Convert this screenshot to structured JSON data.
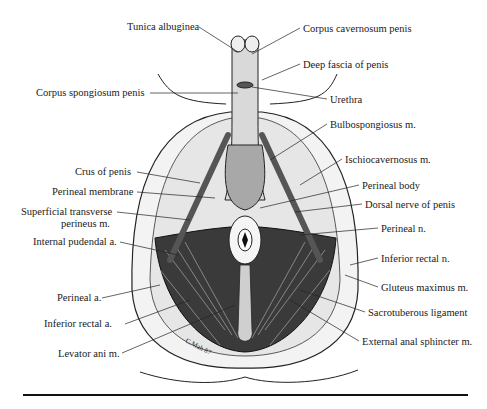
{
  "figure": {
    "signature": "C.Mah 87",
    "labels_left": [
      {
        "id": "tunica-albuginea",
        "text": "Tunica albuginea",
        "x": 127,
        "y": 21
      },
      {
        "id": "corpus-spongiosum",
        "text": "Corpus spongiosum penis",
        "x": 36,
        "y": 87
      },
      {
        "id": "crus-of-penis",
        "text": "Crus of penis",
        "x": 75,
        "y": 166
      },
      {
        "id": "perineal-membrane",
        "text": "Perineal membrane",
        "x": 52,
        "y": 186
      },
      {
        "id": "superficial-transverse-1",
        "text": "Superficial transverse",
        "x": 21,
        "y": 206
      },
      {
        "id": "superficial-transverse-2",
        "text": "perineus m.",
        "x": 61,
        "y": 218
      },
      {
        "id": "internal-pudendal",
        "text": "Internal pudendal a.",
        "x": 33,
        "y": 236
      },
      {
        "id": "perineal-a",
        "text": "Perineal a.",
        "x": 57,
        "y": 292
      },
      {
        "id": "inferior-rectal-a",
        "text": "Inferior rectal a.",
        "x": 44,
        "y": 318
      },
      {
        "id": "levator-ani",
        "text": "Levator ani m.",
        "x": 58,
        "y": 348
      }
    ],
    "labels_right": [
      {
        "id": "corpus-cavernosum",
        "text": "Corpus cavernosum penis",
        "x": 303,
        "y": 23
      },
      {
        "id": "deep-fascia",
        "text": "Deep fascia of penis",
        "x": 303,
        "y": 59
      },
      {
        "id": "urethra",
        "text": "Urethra",
        "x": 330,
        "y": 94
      },
      {
        "id": "bulbospongiosus",
        "text": "Bulbospongiosus m.",
        "x": 330,
        "y": 119
      },
      {
        "id": "ischiocavernosus",
        "text": "Ischiocavernosus m.",
        "x": 345,
        "y": 154
      },
      {
        "id": "perineal-body",
        "text": "Perineal body",
        "x": 362,
        "y": 180
      },
      {
        "id": "dorsal-nerve",
        "text": "Dorsal nerve of penis",
        "x": 365,
        "y": 199
      },
      {
        "id": "perineal-n",
        "text": "Perineal n.",
        "x": 381,
        "y": 223
      },
      {
        "id": "inferior-rectal-n",
        "text": "Inferior rectal n.",
        "x": 381,
        "y": 253
      },
      {
        "id": "gluteus-maximus",
        "text": "Gluteus maximus m.",
        "x": 381,
        "y": 282
      },
      {
        "id": "sacrotuberous",
        "text": "Sacrotuberous ligament",
        "x": 368,
        "y": 307
      },
      {
        "id": "external-anal-sphincter",
        "text": "External anal sphincter m.",
        "x": 362,
        "y": 336
      }
    ]
  }
}
